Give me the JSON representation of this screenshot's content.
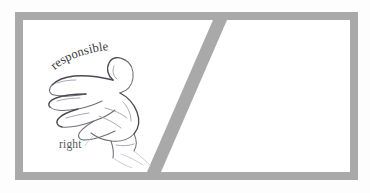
{
  "figure": {
    "background_color": "#fdfdfd",
    "frame_color": "#a9a9a9",
    "panel_background": "#ffffff",
    "divider_color": "#a9a9a9",
    "sketch_color": "#6f6f78"
  },
  "panels": [
    {
      "id": "left-panel",
      "arc_label": "responsible",
      "plain_label": "right",
      "sketch": "open-hand-palm-up-sketch"
    },
    {
      "id": "right-panel",
      "arc_label": "invisible",
      "plain_label": "left",
      "sketch": "open-hand-palm-up-sketch-mirrored"
    }
  ]
}
